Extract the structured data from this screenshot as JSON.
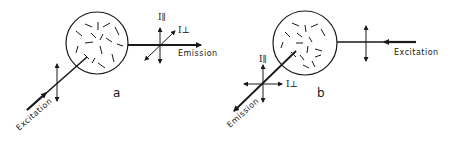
{
  "figure": {
    "panels": [
      {
        "id": "a",
        "label": "a",
        "excitation_label": "Excitation",
        "emission_label": "Emission",
        "i_parallel": "I∥",
        "i_perp": "I⊥"
      },
      {
        "id": "b",
        "label": "b",
        "excitation_label": "Excitation",
        "emission_label": "Emission",
        "i_parallel": "I∥",
        "i_perp": "I⊥"
      }
    ],
    "colors": {
      "ink": "#1a1a1a",
      "background": "#ffffff"
    }
  }
}
